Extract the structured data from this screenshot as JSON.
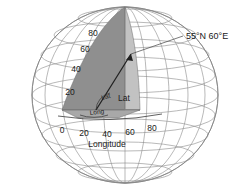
{
  "figure": {
    "callout": {
      "text": "55°N  60°E",
      "latitude_value": "55°N",
      "longitude_value": "60°E"
    },
    "axes": {
      "longitude": {
        "title": "Longitude",
        "ticks": [
          "0",
          "20",
          "40",
          "60",
          "80"
        ]
      },
      "latitude": {
        "ticks": [
          "20",
          "40",
          "60",
          "80"
        ]
      }
    },
    "angle_labels": {
      "latitude": "Lat",
      "longitude": "Long"
    },
    "colors": {
      "wedge_latitude": "#8f8f8f",
      "wedge_longitude": "#c2c2c2",
      "wedge_base": "#a8a8a8",
      "graticule": "#8a8a8a",
      "outline": "#7a7a7a",
      "text": "#1a1a1a",
      "background": "#ffffff"
    }
  }
}
